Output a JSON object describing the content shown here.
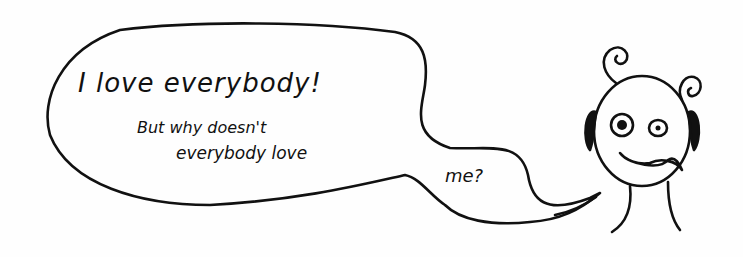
{
  "cartoon": {
    "speech_bubble": {
      "line1": "I love everybody!",
      "line2": "But why doesn't",
      "line3": "everybody love",
      "line4": "me?"
    },
    "character": "round-faced creature with curly antennae and worried expression",
    "colors": {
      "ink": "#111111",
      "paper": "#fefefe"
    }
  }
}
